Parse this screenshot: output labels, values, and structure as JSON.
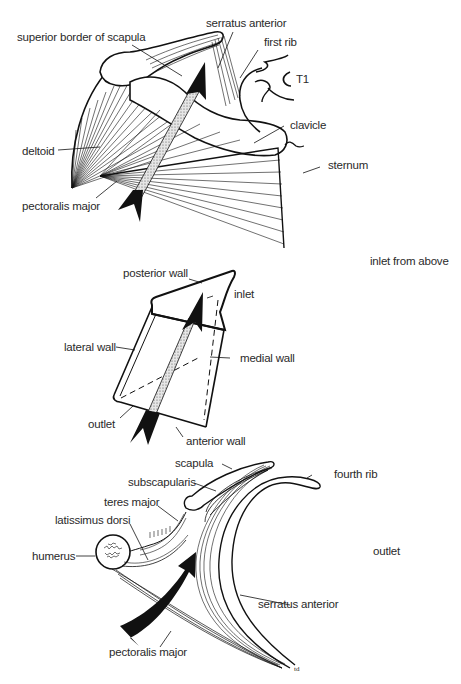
{
  "figure": {
    "panels": [
      {
        "id": "shoulder",
        "description": "anterior view of shoulder with arrow through axilla",
        "labels": {
          "superior_border_of_scapula": "superior border of scapula",
          "serratus_anterior": "serratus anterior",
          "first_rib": "first rib",
          "t1": "T1",
          "clavicle": "clavicle",
          "sternum": "sternum",
          "deltoid": "deltoid",
          "pectoralis_major": "pectoralis major"
        }
      },
      {
        "id": "pyramid",
        "description": "axilla as truncated pyramid",
        "labels": {
          "posterior_wall": "posterior wall",
          "inlet": "inlet",
          "lateral_wall": "lateral wall",
          "medial_wall": "medial wall",
          "outlet": "outlet",
          "anterior_wall": "anterior wall"
        },
        "side_label": "inlet from above"
      },
      {
        "id": "cross_section",
        "description": "horizontal section through axilla",
        "labels": {
          "scapula": "scapula",
          "fourth_rib": "fourth rib",
          "subscapularis": "subscapularis",
          "teres_major": "teres major",
          "latissimus_dorsi": "latissimus dorsi",
          "humerus": "humerus",
          "serratus_anterior": "serratus anterior",
          "pectoralis_major": "pectoralis major"
        },
        "side_label": "outlet",
        "signature": "td"
      }
    ]
  }
}
